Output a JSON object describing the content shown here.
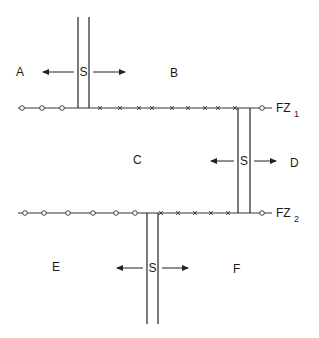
{
  "diagram": {
    "type": "fault-zone spreading diagram",
    "regions": [
      {
        "id": "A",
        "label": "A",
        "x": 16,
        "y": 72
      },
      {
        "id": "B",
        "label": "B",
        "x": 170,
        "y": 73
      },
      {
        "id": "C",
        "label": "C",
        "x": 133,
        "y": 160
      },
      {
        "id": "D",
        "label": "D",
        "x": 290,
        "y": 163
      },
      {
        "id": "E",
        "label": "E",
        "x": 52,
        "y": 267
      },
      {
        "id": "F",
        "label": "F",
        "x": 233,
        "y": 269
      }
    ],
    "spreading_centers": [
      {
        "label": "S",
        "x_left": 78,
        "x_right": 89,
        "y_top": 17,
        "y_bottom": 108,
        "label_y": 72,
        "arrow_left_to": 43,
        "arrow_right_to": 125
      },
      {
        "label": "S",
        "x_left": 238,
        "x_right": 250,
        "y_top": 108,
        "y_bottom": 213,
        "label_y": 161,
        "arrow_left_to": 211,
        "arrow_right_to": 276
      },
      {
        "label": "S",
        "x_left": 147,
        "x_right": 158,
        "y_top": 213,
        "y_bottom": 324,
        "label_y": 268,
        "arrow_left_to": 117,
        "arrow_right_to": 188
      }
    ],
    "fault_zones": [
      {
        "label": "FZ",
        "subscript": "1",
        "y": 108,
        "x_start": 18,
        "x_end": 272,
        "circle_markers": [
          22,
          42,
          62,
          262
        ],
        "x_markers": [
          100,
          120,
          139,
          152,
          172,
          188,
          205,
          218,
          235
        ]
      },
      {
        "label": "FZ",
        "subscript": "2",
        "y": 213,
        "x_start": 18,
        "x_end": 272,
        "circle_markers": [
          25,
          44,
          68,
          93,
          116,
          135,
          262
        ],
        "x_markers": [
          161,
          178,
          195,
          211,
          228
        ]
      }
    ]
  }
}
